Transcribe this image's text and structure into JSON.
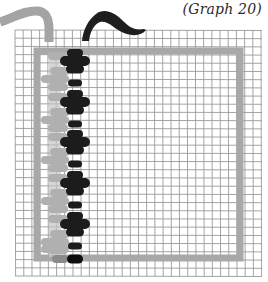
{
  "caption": "(Graph 20)",
  "colors": {
    "background": "#ffffff",
    "grid_line": "#9a9a9a",
    "frame": "#a8a8a8",
    "yarn_light": "#a4a4a4",
    "yarn_dark": "#1e1e1e",
    "stitch_light": "#b0b0b0",
    "stitch_dark": "#1c1c1c"
  },
  "grid": {
    "x_start": 15,
    "x_end": 262,
    "y_start": 30,
    "y_end": 276,
    "cell": 8.2
  },
  "frame": {
    "x": 37,
    "y": 51,
    "width": 203,
    "height": 207,
    "stroke": 7
  },
  "stitch_column": {
    "dark_center_x": 75,
    "light_center_x": 58,
    "motifs": [
      {
        "y": 56,
        "pattern": "cross"
      },
      {
        "y": 97,
        "pattern": "cross"
      },
      {
        "y": 137,
        "pattern": "cross"
      },
      {
        "y": 178,
        "pattern": "cross"
      },
      {
        "y": 219,
        "pattern": "cross"
      }
    ],
    "end_stitch_y": 259
  }
}
